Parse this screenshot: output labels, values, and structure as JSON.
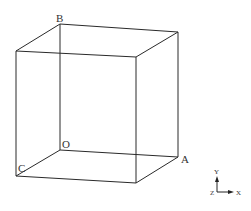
{
  "diagram": {
    "type": "cube-wireframe",
    "line_color": "#2a2a2a",
    "label_color": "#333333",
    "vertices": {
      "B": {
        "x": 60,
        "y": 24
      },
      "BTR": {
        "x": 178,
        "y": 32
      },
      "FTL": {
        "x": 16,
        "y": 51
      },
      "FTR": {
        "x": 136,
        "y": 57
      },
      "O": {
        "x": 60,
        "y": 150
      },
      "A": {
        "x": 178,
        "y": 157
      },
      "C": {
        "x": 16,
        "y": 176
      },
      "FBR": {
        "x": 136,
        "y": 183
      }
    },
    "labels": {
      "B": "B",
      "O": "O",
      "A": "A",
      "C": "C"
    },
    "axis_triad": {
      "y_label": "Y",
      "x_label": "X",
      "z_label": "Z"
    }
  }
}
